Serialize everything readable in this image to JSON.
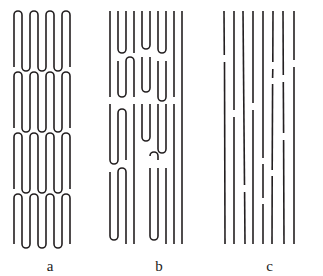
{
  "figure": {
    "background_color": "#ffffff",
    "stroke_color": "#231f20",
    "stroke_width": 1.6,
    "width": 323,
    "height": 276
  },
  "panels": [
    {
      "id": "a",
      "label": "a",
      "name": "regular-adjacent-reentry-folding",
      "description": "Four stacked blocks of regularly folded serpentine chains with sharp adjacent re-entry loops",
      "block_count": 4,
      "strands_per_block": 9
    },
    {
      "id": "b",
      "label": "b",
      "name": "irregular-loose-loop-folding",
      "description": "Irregular switchboard-like folding with loops of varying length and depth",
      "block_count": 3,
      "strands_per_block": 9
    },
    {
      "id": "c",
      "label": "c",
      "name": "fringed-micelle-broken-chains",
      "description": "Near-parallel vertical chain segments with small breaks at random heights",
      "line_count": 8,
      "break_count": 11
    }
  ],
  "geometry": {
    "panel_a": {
      "x_positions": [
        14,
        22,
        30,
        38,
        46,
        54,
        62,
        70
      ],
      "blocks": [
        {
          "top": 11,
          "bottom": 67
        },
        {
          "top": 72,
          "bottom": 128
        },
        {
          "top": 133,
          "bottom": 189
        },
        {
          "top": 194,
          "bottom": 244
        }
      ],
      "loop_radius": 4
    },
    "panel_b": {
      "x_positions": [
        6,
        14,
        22,
        30,
        38,
        46,
        54,
        62,
        70,
        78
      ],
      "loop_radius": 4
    },
    "panel_c": {
      "lines": [
        {
          "x_top": 8,
          "x_bottom": 9,
          "gaps": [
            [
              55,
              62
            ]
          ]
        },
        {
          "x_top": 18,
          "x_bottom": 18,
          "gaps": [
            [
              110,
              117
            ]
          ]
        },
        {
          "x_top": 27,
          "x_bottom": 29,
          "gaps": [
            [
              185,
              192
            ]
          ]
        },
        {
          "x_top": 37,
          "x_bottom": 37,
          "gaps": [
            [
              103,
              110
            ]
          ]
        },
        {
          "x_top": 47,
          "x_bottom": 47,
          "gaps": [
            [
              158,
              164
            ],
            [
              198,
              204
            ]
          ]
        },
        {
          "x_top": 57,
          "x_bottom": 56,
          "gaps": [
            [
              62,
              69
            ],
            [
              78,
              84
            ],
            [
              170,
              176
            ]
          ]
        },
        {
          "x_top": 67,
          "x_bottom": 68,
          "gaps": [
            [
              75,
              82
            ],
            [
              133,
              140
            ]
          ]
        },
        {
          "x_top": 78,
          "x_bottom": 78,
          "gaps": [
            [
              60,
              67
            ]
          ]
        }
      ],
      "top": 11,
      "bottom": 244
    }
  }
}
